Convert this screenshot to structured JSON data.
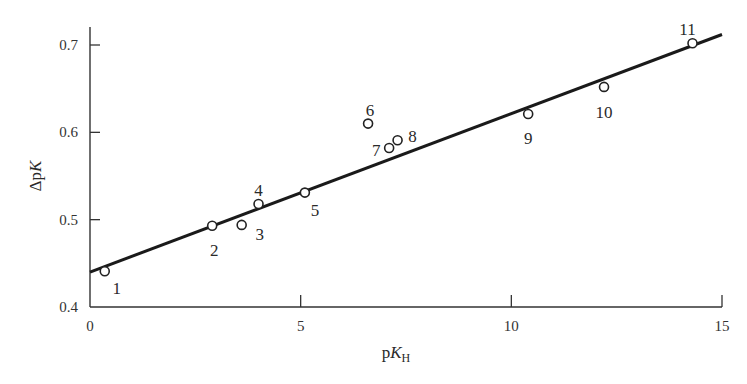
{
  "chart_data": {
    "type": "scatter",
    "title": "",
    "xlabel": "pK_H",
    "ylabel": "ΔpK",
    "xlim": [
      0,
      15
    ],
    "ylim": [
      0.4,
      0.7
    ],
    "xticks": [
      0,
      5,
      10,
      15
    ],
    "yticks": [
      0.4,
      0.5,
      0.6,
      0.7
    ],
    "xtick_labels": [
      "0",
      "5",
      "10",
      "15"
    ],
    "ytick_labels": [
      "0.4",
      "0.5",
      "0.6",
      "0.7"
    ],
    "grid": false,
    "legend": null,
    "points": [
      {
        "label": "1",
        "x": 0.35,
        "y": 0.441
      },
      {
        "label": "2",
        "x": 2.9,
        "y": 0.493
      },
      {
        "label": "3",
        "x": 3.6,
        "y": 0.494
      },
      {
        "label": "4",
        "x": 4.0,
        "y": 0.518
      },
      {
        "label": "5",
        "x": 5.1,
        "y": 0.531
      },
      {
        "label": "6",
        "x": 6.6,
        "y": 0.61
      },
      {
        "label": "7",
        "x": 7.1,
        "y": 0.582
      },
      {
        "label": "8",
        "x": 7.3,
        "y": 0.591
      },
      {
        "label": "9",
        "x": 10.4,
        "y": 0.621
      },
      {
        "label": "10",
        "x": 12.2,
        "y": 0.652
      },
      {
        "label": "11",
        "x": 14.3,
        "y": 0.702
      }
    ],
    "fit_line": {
      "x": [
        0,
        15
      ],
      "y": [
        0.44,
        0.712
      ]
    }
  },
  "axes": {
    "x_title_main": "p",
    "x_title_italic": "K",
    "x_title_sub": "H",
    "y_title_main": "Δp",
    "y_title_italic": "K"
  }
}
